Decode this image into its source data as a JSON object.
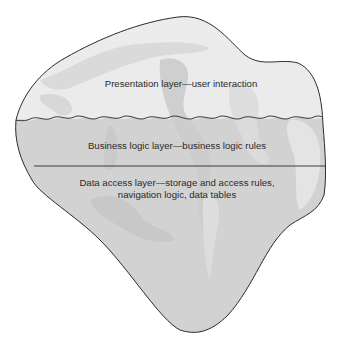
{
  "diagram": {
    "type": "iceberg-layer-diagram",
    "layers": [
      {
        "id": "presentation",
        "label": "Presentation layer—user interaction"
      },
      {
        "id": "business",
        "label": "Business logic layer—business logic rules"
      },
      {
        "id": "data",
        "label_line1": "Data access layer—storage and access rules,",
        "label_line2": "navigation logic, data tables"
      }
    ],
    "colors": {
      "outline": "#2b2b2b",
      "top_fill": "#ededed",
      "bottom_fill": "#cfcfcf",
      "texture_light": "#f4f4f4",
      "texture_dark": "#c2c2c2"
    }
  }
}
